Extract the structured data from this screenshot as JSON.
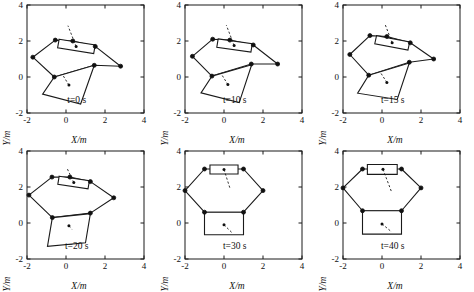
{
  "figure": {
    "axis": {
      "xlabel": "X/m",
      "ylabel": "Y/m",
      "xticks": [
        "-2",
        "0",
        "2",
        "4"
      ],
      "yticks": [
        "-2",
        "0",
        "2",
        "4"
      ],
      "xlim": [
        -2,
        4
      ],
      "ylim": [
        -2,
        4
      ],
      "grid": false
    },
    "line_color": "#1a1a1a",
    "background": "#ffffff"
  },
  "chart_data": {
    "type": "scatter",
    "title": "",
    "xlabel": "X/m",
    "ylabel": "Y/m",
    "xlim": [
      -2,
      4
    ],
    "ylim": [
      -2,
      4
    ],
    "xticks": [
      -2,
      0,
      2,
      4
    ],
    "yticks": [
      -2,
      0,
      2,
      4
    ],
    "grid": false,
    "legend": "none",
    "panels": [
      {
        "label": "t=0 s",
        "time_s": 0,
        "hexagon_vertices": [
          [
            -0.55,
            2.05
          ],
          [
            0.35,
            2.0
          ],
          [
            1.5,
            1.7
          ],
          [
            2.8,
            0.6
          ],
          [
            1.45,
            0.65
          ],
          [
            -0.6,
            0.0
          ],
          [
            -1.7,
            1.1
          ]
        ],
        "upper_module": {
          "type": "rectangle",
          "corners": [
            [
              -0.35,
              2.1
            ],
            [
              1.5,
              1.78
            ],
            [
              1.42,
              1.3
            ],
            [
              -0.43,
              1.62
            ]
          ],
          "center": [
            0.52,
            1.7
          ],
          "pointer_end": [
            0.1,
            2.85
          ]
        },
        "lower_platform": {
          "type": "square",
          "corners": [
            [
              -0.6,
              0.0
            ],
            [
              1.45,
              0.65
            ],
            [
              0.75,
              -1.5
            ],
            [
              -1.2,
              -0.95
            ]
          ],
          "center": [
            0.15,
            -0.45
          ],
          "pointer_end": [
            -0.15,
            0.08
          ]
        },
        "joints": [
          [
            -0.55,
            2.05
          ],
          [
            1.5,
            1.7
          ],
          [
            2.8,
            0.6
          ],
          [
            1.45,
            0.65
          ],
          [
            -0.6,
            0.0
          ],
          [
            -1.7,
            1.1
          ],
          [
            0.35,
            2.0
          ]
        ]
      },
      {
        "label": "t=10 s",
        "time_s": 10,
        "hexagon_vertices": [
          [
            -0.58,
            2.1
          ],
          [
            0.3,
            2.05
          ],
          [
            1.5,
            1.78
          ],
          [
            2.75,
            0.72
          ],
          [
            1.4,
            0.72
          ],
          [
            -0.62,
            0.05
          ],
          [
            -1.62,
            1.15
          ]
        ],
        "upper_module": {
          "type": "rectangle",
          "corners": [
            [
              -0.3,
              2.12
            ],
            [
              1.45,
              1.85
            ],
            [
              1.38,
              1.38
            ],
            [
              -0.37,
              1.65
            ]
          ],
          "center": [
            0.52,
            1.75
          ],
          "pointer_end": [
            0.12,
            2.88
          ]
        },
        "lower_platform": {
          "type": "square",
          "corners": [
            [
              -0.62,
              0.05
            ],
            [
              1.42,
              0.68
            ],
            [
              0.78,
              -1.42
            ],
            [
              -1.18,
              -0.88
            ]
          ],
          "center": [
            0.2,
            -0.42
          ],
          "pointer_end": [
            -0.1,
            0.1
          ]
        },
        "joints": [
          [
            -0.58,
            2.1
          ],
          [
            1.5,
            1.78
          ],
          [
            2.75,
            0.72
          ],
          [
            1.4,
            0.72
          ],
          [
            -0.62,
            0.05
          ],
          [
            -1.62,
            1.15
          ],
          [
            0.3,
            2.05
          ]
        ]
      },
      {
        "label": "t=15 s",
        "time_s": 15,
        "hexagon_vertices": [
          [
            -0.62,
            2.3
          ],
          [
            0.25,
            2.25
          ],
          [
            1.45,
            1.9
          ],
          [
            2.65,
            1.0
          ],
          [
            1.4,
            0.82
          ],
          [
            -0.68,
            0.1
          ],
          [
            -1.65,
            1.25
          ]
        ],
        "upper_module": {
          "type": "rectangle",
          "corners": [
            [
              -0.28,
              2.3
            ],
            [
              1.42,
              1.95
            ],
            [
              1.33,
              1.5
            ],
            [
              -0.37,
              1.85
            ]
          ],
          "center": [
            0.52,
            1.9
          ],
          "pointer_end": [
            0.15,
            2.95
          ]
        },
        "lower_platform": {
          "type": "square",
          "corners": [
            [
              -0.68,
              0.1
            ],
            [
              1.4,
              0.78
            ],
            [
              0.78,
              -1.25
            ],
            [
              -1.25,
              -0.9
            ]
          ],
          "center": [
            0.25,
            -0.3
          ],
          "pointer_end": [
            -0.05,
            0.2
          ]
        },
        "joints": [
          [
            -0.62,
            2.3
          ],
          [
            1.45,
            1.9
          ],
          [
            2.65,
            1.0
          ],
          [
            1.4,
            0.82
          ],
          [
            -0.68,
            0.1
          ],
          [
            -1.65,
            1.25
          ],
          [
            0.25,
            2.25
          ]
        ]
      },
      {
        "label": "t=20 s",
        "time_s": 20,
        "hexagon_vertices": [
          [
            -0.72,
            2.55
          ],
          [
            0.2,
            2.55
          ],
          [
            1.25,
            2.3
          ],
          [
            2.45,
            1.4
          ],
          [
            1.25,
            0.55
          ],
          [
            -0.7,
            0.3
          ],
          [
            -1.9,
            1.55
          ]
        ],
        "upper_module": {
          "type": "rectangle",
          "corners": [
            [
              -0.35,
              2.6
            ],
            [
              1.2,
              2.35
            ],
            [
              1.13,
              1.9
            ],
            [
              -0.42,
              2.15
            ]
          ],
          "center": [
            0.4,
            2.25
          ],
          "pointer_end": [
            0.05,
            3.05
          ]
        },
        "lower_platform": {
          "type": "square",
          "corners": [
            [
              -0.7,
              0.3
            ],
            [
              1.25,
              0.52
            ],
            [
              1.0,
              -1.1
            ],
            [
              -0.95,
              -1.3
            ]
          ],
          "center": [
            0.15,
            -0.15
          ],
          "pointer_end": [
            0.3,
            -0.35
          ]
        },
        "joints": [
          [
            -0.72,
            2.55
          ],
          [
            1.25,
            2.3
          ],
          [
            2.45,
            1.4
          ],
          [
            1.25,
            0.55
          ],
          [
            -0.7,
            0.3
          ],
          [
            -1.9,
            1.55
          ],
          [
            0.2,
            2.55
          ]
        ]
      },
      {
        "label": "t=30 s",
        "time_s": 30,
        "hexagon_vertices": [
          [
            -1.0,
            3.0
          ],
          [
            1.0,
            3.0
          ],
          [
            2.0,
            1.8
          ],
          [
            1.0,
            0.6
          ],
          [
            -1.0,
            0.6
          ],
          [
            -2.0,
            1.8
          ]
        ],
        "upper_module": {
          "type": "rectangle",
          "corners": [
            [
              -0.72,
              3.22
            ],
            [
              0.72,
              3.22
            ],
            [
              0.72,
              2.72
            ],
            [
              -0.72,
              2.72
            ]
          ],
          "center": [
            0.0,
            2.97
          ],
          "pointer_end": [
            0.3,
            1.95
          ]
        },
        "lower_platform": {
          "type": "square",
          "corners": [
            [
              -1.0,
              0.6
            ],
            [
              1.0,
              0.6
            ],
            [
              1.0,
              -0.65
            ],
            [
              -1.0,
              -0.65
            ]
          ],
          "center": [
            0.0,
            -0.1
          ],
          "pointer_end": [
            0.45,
            -0.58
          ]
        },
        "joints": [
          [
            -1.0,
            3.0
          ],
          [
            1.0,
            3.0
          ],
          [
            2.0,
            1.8
          ],
          [
            1.0,
            0.6
          ],
          [
            -1.0,
            0.6
          ],
          [
            -2.0,
            1.8
          ]
        ]
      },
      {
        "label": "t=40 s",
        "time_s": 40,
        "hexagon_vertices": [
          [
            -1.0,
            3.0
          ],
          [
            1.0,
            3.0
          ],
          [
            2.0,
            1.95
          ],
          [
            1.0,
            0.68
          ],
          [
            -1.0,
            0.68
          ],
          [
            -2.0,
            1.95
          ]
        ],
        "upper_module": {
          "type": "rectangle",
          "corners": [
            [
              -0.75,
              3.25
            ],
            [
              0.78,
              3.25
            ],
            [
              0.78,
              2.7
            ],
            [
              -0.75,
              2.7
            ]
          ],
          "center": [
            0.05,
            2.98
          ],
          "pointer_end": [
            0.5,
            1.7
          ]
        },
        "lower_platform": {
          "type": "square",
          "corners": [
            [
              -1.0,
              0.68
            ],
            [
              1.0,
              0.68
            ],
            [
              1.0,
              -0.62
            ],
            [
              -1.0,
              -0.62
            ]
          ],
          "center": [
            0.0,
            -0.05
          ],
          "pointer_end": [
            0.5,
            -0.5
          ]
        },
        "joints": [
          [
            -1.0,
            3.0
          ],
          [
            1.0,
            3.0
          ],
          [
            2.0,
            1.95
          ],
          [
            1.0,
            0.68
          ],
          [
            -1.0,
            0.68
          ],
          [
            -2.0,
            1.95
          ]
        ]
      }
    ]
  }
}
